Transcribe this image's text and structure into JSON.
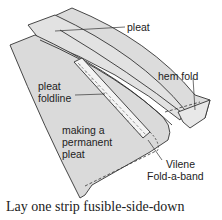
{
  "diagram": {
    "labels": {
      "pleat": "pleat",
      "hem_fold": "hem fold",
      "pleat_foldline_1": "pleat",
      "pleat_foldline_2": "foldline",
      "making_1": "making a",
      "making_2": "permanent",
      "making_3": "pleat",
      "vilene_1": "Vilene",
      "vilene_2": "Fold-a-band"
    },
    "caption": "Lay one strip fusible-side-down",
    "colors": {
      "fabric": "#dcdcdc",
      "fabric_light": "#e6e6e6",
      "outline": "#333333",
      "background": "#ffffff"
    }
  }
}
